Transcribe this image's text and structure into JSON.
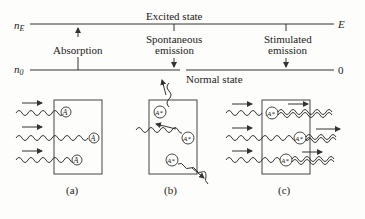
{
  "diagram": {
    "levels": {
      "upper_label": "n",
      "upper_sub": "E",
      "upper_right": "E",
      "lower_label": "n",
      "lower_sub": "0",
      "lower_right": "0",
      "excited_state": "Excited state",
      "normal_state": "Normal state"
    },
    "transitions": {
      "absorption": "Absorption",
      "spontaneous_line1": "Spontaneous",
      "spontaneous_line2": "emission",
      "stimulated_line1": "Stimulated",
      "stimulated_line2": "emission"
    },
    "panels": {
      "a": {
        "caption": "(a)",
        "atom": "A"
      },
      "b": {
        "caption": "(b)",
        "atom": "A*"
      },
      "c": {
        "caption": "(c)",
        "atom": "A*"
      }
    }
  }
}
